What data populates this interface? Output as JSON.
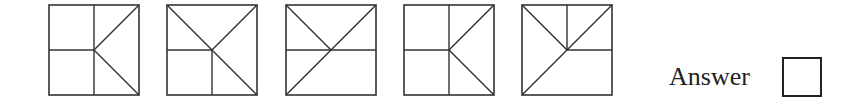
{
  "puzzle": {
    "figures": [
      {
        "id": 1,
        "x": 48,
        "lines": [
          [
            0.5,
            0,
            0.5,
            1
          ],
          [
            0,
            0.5,
            0.5,
            0.5
          ],
          [
            0.5,
            0.5,
            1,
            0
          ],
          [
            0.5,
            0.5,
            1,
            1
          ]
        ]
      },
      {
        "id": 2,
        "x": 166,
        "lines": [
          [
            0,
            0,
            1,
            1
          ],
          [
            0.5,
            0.5,
            1,
            0
          ],
          [
            0,
            0.5,
            0.5,
            0.5
          ],
          [
            0.5,
            0.5,
            0.5,
            1
          ]
        ]
      },
      {
        "id": 3,
        "x": 285,
        "lines": [
          [
            0,
            0.5,
            1,
            0.5
          ],
          [
            0,
            0,
            0.5,
            0.5
          ],
          [
            0,
            1,
            1,
            0
          ]
        ]
      },
      {
        "id": 4,
        "x": 403,
        "lines": [
          [
            0.5,
            0,
            0.5,
            1
          ],
          [
            0,
            0.5,
            0.5,
            0.5
          ],
          [
            0.5,
            0.5,
            1,
            0
          ],
          [
            0.5,
            0.5,
            1,
            1
          ]
        ]
      },
      {
        "id": 5,
        "x": 521,
        "lines": [
          [
            0.5,
            0,
            0.5,
            0.5
          ],
          [
            0.5,
            0.5,
            1,
            0.5
          ],
          [
            0,
            0,
            0.5,
            0.5
          ],
          [
            0,
            1,
            1,
            0
          ]
        ]
      }
    ],
    "figure_size": 90,
    "stroke_color": "#333333",
    "answer_label": "Answer"
  }
}
